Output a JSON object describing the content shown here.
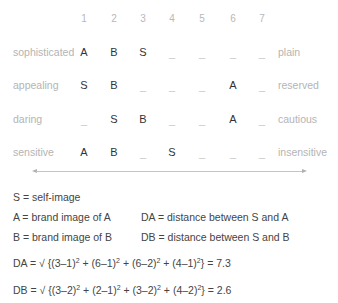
{
  "scale": {
    "columns": [
      "1",
      "2",
      "3",
      "4",
      "5",
      "6",
      "7"
    ],
    "column_x": [
      84,
      114,
      143,
      172,
      202,
      233,
      262
    ],
    "rows": [
      {
        "left": "sophisticated",
        "right": "plain",
        "cells": [
          "A",
          "B",
          "S",
          "_",
          "_",
          "_",
          "_"
        ]
      },
      {
        "left": "appealing",
        "right": "reserved",
        "cells": [
          "S",
          "B",
          "_",
          "_",
          "_",
          "A",
          "_"
        ]
      },
      {
        "left": "daring",
        "right": "cautious",
        "cells": [
          "_",
          "S",
          "B",
          "_",
          "_",
          "A",
          "_"
        ]
      },
      {
        "left": "sensitive",
        "right": "insensitive",
        "cells": [
          "A",
          "B",
          "_",
          "S",
          "_",
          "_",
          "_"
        ]
      }
    ]
  },
  "legend": {
    "s": "S = self-image",
    "a": "A = brand image of A",
    "b": "B = brand image of B",
    "da": "DA = distance between S and A",
    "db": "DB = distance between S and B"
  },
  "formulas": {
    "da": {
      "prefix": "DA = √ {",
      "terms": [
        "(3–1)",
        "(6–1)",
        "(6–2)",
        "(4–1)"
      ],
      "exponent": "2",
      "result": "} = 7.3"
    },
    "db": {
      "prefix": "DB = √ {",
      "terms": [
        "(3–2)",
        "(2–1)",
        "(3–2)",
        "(4–2)"
      ],
      "exponent": "2",
      "result": "} = 2.6"
    }
  },
  "colors": {
    "label_gray": "#b4b4b4",
    "mark_dark": "#333333",
    "text_dark": "#444444",
    "arrow_gray": "#c4c4c4"
  }
}
